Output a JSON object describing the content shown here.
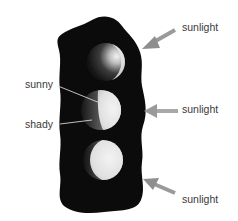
{
  "figure": {
    "colors": {
      "background": "#ffffff",
      "blob": "#0b0b0b",
      "sphere_light": "#e6e6e6",
      "sphere_dark": "#1a1a1a",
      "arrow": "#9a9a9a",
      "leader_line": "#cfcfcf",
      "text": "#3a3a3a"
    }
  },
  "labels": {
    "sunny": "sunny",
    "shady": "shady"
  },
  "arrows": [
    {
      "label": "sunlight",
      "direction": "from upper-right"
    },
    {
      "label": "sunlight",
      "direction": "from right"
    },
    {
      "label": "sunlight",
      "direction": "from lower-right"
    }
  ],
  "spheres": [
    {
      "position": "top",
      "lit_side": "upper-right crescent"
    },
    {
      "position": "middle",
      "lit_side": "right half"
    },
    {
      "position": "bottom",
      "lit_side": "mostly lit, shadow on left edge"
    }
  ]
}
